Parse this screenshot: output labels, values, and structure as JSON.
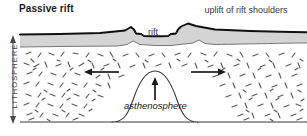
{
  "figure": {
    "title": "Passive rift",
    "labels": {
      "rift": "rift",
      "uplift": "uplift of rift shoulders",
      "asthenosphere": "asthenosphere",
      "lithosphere": "LITHOSPHERE"
    },
    "colors": {
      "crust_fill": "#d4d4d4",
      "crust_line": "#111111",
      "outline": "#333333",
      "text": "#2b2b2b",
      "title_text": "#1a1a1a",
      "hatch": "#555555",
      "background": "#ffffff"
    },
    "diagram_type": "geological-cross-section",
    "arrows": {
      "extension_left": "left-pointing extension arrow",
      "extension_right": "right-pointing extension arrow",
      "upwelling": "upward asthenosphere upwelling arrow",
      "lithosphere_extent": "vertical double-headed thickness arrow"
    },
    "features": [
      "crust layer",
      "rift graben",
      "rift shoulders",
      "lithosphere mantle",
      "asthenosphere dome",
      "base of lithosphere"
    ]
  }
}
